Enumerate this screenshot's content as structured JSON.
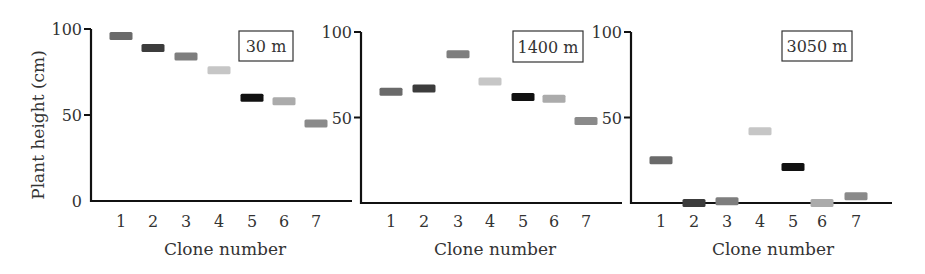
{
  "chart_data": [
    {
      "type": "scatter",
      "marker": "horizontal-bar",
      "title": "30 m",
      "xlabel": "Clone number",
      "ylabel": "Plant height (cm)",
      "categories": [
        "1",
        "2",
        "3",
        "4",
        "5",
        "6",
        "7"
      ],
      "values": [
        96,
        89,
        84,
        76,
        60,
        58,
        45
      ],
      "ylim": [
        0,
        100
      ],
      "yticks": [
        "0",
        "50",
        "100"
      ],
      "grid": false
    },
    {
      "type": "scatter",
      "marker": "horizontal-bar",
      "title": "1400 m",
      "xlabel": "Clone number",
      "ylabel": "",
      "categories": [
        "1",
        "2",
        "3",
        "4",
        "5",
        "6",
        "7"
      ],
      "values": [
        65,
        67,
        87,
        71,
        62,
        61,
        48
      ],
      "ylim": [
        0,
        100
      ],
      "yticks": [
        "50",
        "100"
      ],
      "grid": false
    },
    {
      "type": "scatter",
      "marker": "horizontal-bar",
      "title": "3050 m",
      "xlabel": "Clone number",
      "ylabel": "",
      "categories": [
        "1",
        "2",
        "3",
        "4",
        "5",
        "6",
        "7"
      ],
      "values": [
        25,
        0,
        1,
        42,
        21,
        0,
        4
      ],
      "ylim": [
        0,
        100
      ],
      "yticks": [
        "50",
        "100"
      ],
      "grid": false
    }
  ],
  "clone_colors": [
    "#6a6a6a",
    "#3c3c3c",
    "#7e7e7e",
    "#c6c6c6",
    "#111111",
    "#ababab",
    "#8a8a8a"
  ],
  "axis_color": "#111111",
  "panels": [
    {
      "label": "30 m",
      "ylabel": "Plant height (cm)",
      "xlabel": "Clone number",
      "y_axis_x": 91,
      "x_axis_right": 352,
      "y0": 201,
      "y100": 29,
      "tick_x": [
        121,
        153,
        186,
        219,
        252,
        284,
        316
      ],
      "tick_labels": [
        {
          "v": 0,
          "t": "0"
        },
        {
          "v": 50,
          "t": "50"
        },
        {
          "v": 100,
          "t": "100"
        }
      ],
      "box": {
        "x": 239,
        "y": 31,
        "w": 54,
        "h": 30
      },
      "xlabel_x": 225
    },
    {
      "label": "1400 m",
      "ylabel": "",
      "xlabel": "Clone number",
      "y_axis_x": 361,
      "x_axis_right": 622,
      "y0": 203,
      "y100": 32,
      "tick_x": [
        391,
        424,
        458,
        490,
        523,
        554,
        586
      ],
      "tick_labels": [
        {
          "v": 50,
          "t": "50"
        },
        {
          "v": 100,
          "t": "100"
        }
      ],
      "box": {
        "x": 513,
        "y": 31,
        "w": 70,
        "h": 31
      },
      "xlabel_x": 495
    },
    {
      "label": "3050 m",
      "ylabel": "",
      "xlabel": "Clone number",
      "y_axis_x": 631,
      "x_axis_right": 892,
      "y0": 203,
      "y100": 32,
      "tick_x": [
        661,
        694,
        727,
        760,
        793,
        822,
        856
      ],
      "tick_labels": [
        {
          "v": 50,
          "t": "50"
        },
        {
          "v": 100,
          "t": "100"
        }
      ],
      "box": {
        "x": 782,
        "y": 31,
        "w": 70,
        "h": 30
      },
      "xlabel_x": 773
    }
  ]
}
